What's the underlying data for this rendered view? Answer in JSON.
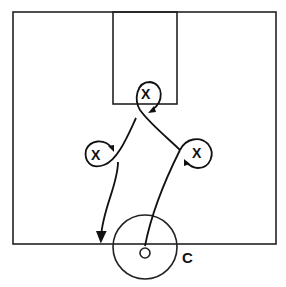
{
  "diagram": {
    "type": "basketball-play",
    "court": {
      "outline": {
        "x": 13,
        "y": 12,
        "w": 263,
        "h": 232
      },
      "lane": {
        "x": 113,
        "y": 12,
        "w": 64,
        "h": 92
      },
      "center_circle": {
        "cx": 145,
        "cy": 247,
        "r": 32
      },
      "color": "#222222"
    },
    "players": [
      {
        "id": "x-top",
        "label": "X",
        "x": 147,
        "y": 94
      },
      {
        "id": "x-left",
        "label": "X",
        "x": 97,
        "y": 155
      },
      {
        "id": "x-right",
        "label": "X",
        "x": 198,
        "y": 153
      }
    ],
    "ball_holder": {
      "label": "O",
      "x": 145,
      "y": 253
    },
    "coach": {
      "label": "C",
      "x": 188,
      "y": 257
    }
  }
}
